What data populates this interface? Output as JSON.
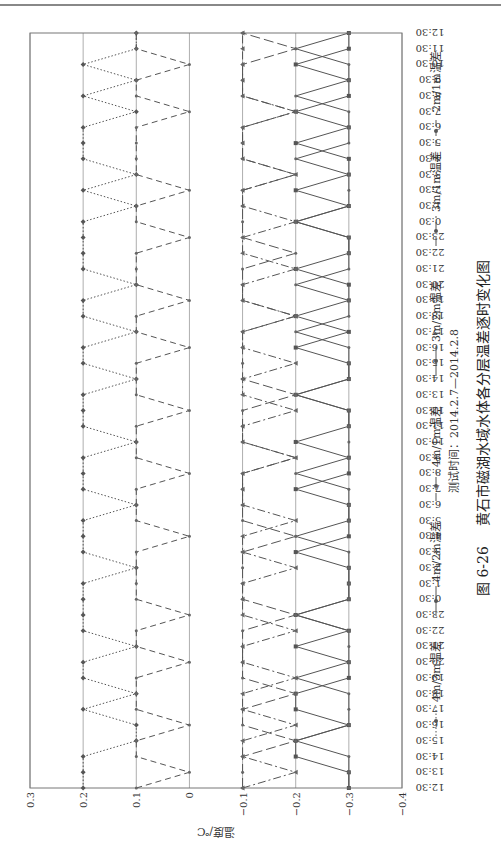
{
  "chart_data": {
    "type": "line",
    "title": "黄石市磁湖水域水体各分层温差逐时变化图",
    "figure_label": "图 6-26",
    "subtitle": "测试时间：2014.2.7—2014.2.8",
    "xlabel": "",
    "ylabel": "温度/℃",
    "ylim": [
      -0.4,
      0.3
    ],
    "yticks": [
      "0.3",
      "0.2",
      "0.1",
      "0",
      "−0.1",
      "−0.2",
      "−0.3",
      "−0.4"
    ],
    "x": [
      "12:30",
      "13:30",
      "14:30",
      "15:30",
      "16:30",
      "17:30",
      "18:30",
      "19:30",
      "20:30",
      "21:30",
      "22:30",
      "23:30",
      "0:30",
      "1:30",
      "2:30",
      "3:30",
      "4:30",
      "5:30",
      "6:30",
      "7:30",
      "8:30",
      "9:30",
      "10:30",
      "11:30",
      "12:30",
      "13:30",
      "14:30",
      "15:30",
      "16:30",
      "17:30",
      "18:30",
      "19:30",
      "20:30",
      "21:30",
      "22:30",
      "23:30",
      "0:30",
      "1:30",
      "2:30",
      "3:30",
      "4:30",
      "5:30",
      "6:30",
      "7:30",
      "8:30",
      "9:30",
      "10:30",
      "11:30",
      "12:30"
    ],
    "grid": true,
    "legend_position": "bottom",
    "series": [
      {
        "name": "4m/3m温差",
        "marker": "diamond",
        "dash": "dotted",
        "values": [
          0.2,
          0.2,
          0.2,
          0.1,
          0.1,
          0.2,
          0.1,
          0.2,
          0.2,
          0.1,
          0.2,
          0.2,
          0.2,
          0.2,
          0.1,
          0.2,
          0.2,
          0.2,
          0.1,
          0.2,
          0.2,
          0.2,
          0.1,
          0.2,
          0.2,
          0.2,
          0.1,
          0.2,
          0.2,
          0.1,
          0.2,
          0.2,
          0.1,
          0.2,
          0.2,
          0.2,
          0.2,
          0.1,
          0.2,
          0.1,
          0.2,
          0.2,
          0.2,
          0.1,
          0.2,
          0.1,
          0.2,
          0.1,
          0.1
        ]
      },
      {
        "name": "4m/2m温差",
        "marker": "square",
        "dash": "solid",
        "values": [
          -0.3,
          -0.3,
          -0.2,
          -0.2,
          -0.3,
          -0.2,
          -0.2,
          -0.3,
          -0.3,
          -0.2,
          -0.3,
          -0.2,
          -0.3,
          -0.3,
          -0.3,
          -0.2,
          -0.3,
          -0.3,
          -0.3,
          -0.2,
          -0.3,
          -0.3,
          -0.2,
          -0.3,
          -0.3,
          -0.2,
          -0.3,
          -0.3,
          -0.2,
          -0.3,
          -0.2,
          -0.3,
          -0.3,
          -0.2,
          -0.3,
          -0.3,
          -0.2,
          -0.3,
          -0.2,
          -0.3,
          -0.3,
          -0.2,
          -0.3,
          -0.2,
          -0.3,
          -0.3,
          -0.2,
          -0.3,
          -0.3
        ]
      },
      {
        "name": "4m/1m温差",
        "marker": "triangle",
        "dash": "dashdot",
        "values": [
          -0.1,
          -0.2,
          -0.1,
          -0.1,
          -0.2,
          -0.1,
          -0.1,
          -0.2,
          -0.1,
          -0.1,
          -0.2,
          -0.1,
          -0.1,
          -0.1,
          -0.2,
          -0.1,
          -0.1,
          -0.2,
          -0.1,
          -0.1,
          -0.1,
          -0.2,
          -0.1,
          -0.1,
          -0.2,
          -0.1,
          -0.1,
          -0.2,
          -0.1,
          -0.1,
          -0.2,
          -0.1,
          -0.1,
          -0.2,
          -0.1,
          -0.1,
          -0.2,
          -0.1,
          -0.1,
          -0.2,
          -0.1,
          -0.1,
          -0.1,
          -0.2,
          -0.1,
          -0.1,
          -0.1,
          -0.1,
          -0.1
        ]
      },
      {
        "name": "3m/2m温差",
        "marker": "x",
        "dash": "solid",
        "values": [
          -0.3,
          -0.3,
          -0.3,
          -0.2,
          -0.3,
          -0.3,
          -0.3,
          -0.2,
          -0.3,
          -0.3,
          -0.3,
          -0.2,
          -0.3,
          -0.3,
          -0.3,
          -0.3,
          -0.2,
          -0.3,
          -0.3,
          -0.3,
          -0.2,
          -0.3,
          -0.3,
          -0.3,
          -0.3,
          -0.2,
          -0.3,
          -0.3,
          -0.3,
          -0.2,
          -0.3,
          -0.3,
          -0.2,
          -0.3,
          -0.3,
          -0.3,
          -0.2,
          -0.3,
          -0.3,
          -0.3,
          -0.2,
          -0.3,
          -0.3,
          -0.3,
          -0.2,
          -0.3,
          -0.3,
          -0.2,
          -0.3
        ]
      },
      {
        "name": "3m/1m温差",
        "marker": "star",
        "dash": "longdash",
        "values": [
          -0.1,
          -0.1,
          -0.1,
          -0.2,
          -0.1,
          -0.1,
          -0.2,
          -0.1,
          -0.1,
          -0.1,
          -0.1,
          -0.2,
          -0.1,
          -0.1,
          -0.1,
          -0.1,
          -0.2,
          -0.1,
          -0.1,
          -0.1,
          -0.1,
          -0.2,
          -0.1,
          -0.1,
          -0.1,
          -0.2,
          -0.1,
          -0.1,
          -0.1,
          -0.1,
          -0.2,
          -0.1,
          -0.1,
          -0.1,
          -0.2,
          -0.1,
          -0.1,
          -0.1,
          -0.1,
          -0.2,
          -0.1,
          -0.1,
          -0.1,
          -0.2,
          -0.1,
          -0.1,
          -0.1,
          -0.2,
          -0.1
        ]
      },
      {
        "name": "2m/1m温差",
        "marker": "plus",
        "dash": "dashed",
        "values": [
          0.1,
          0,
          0.1,
          0.1,
          0,
          0.1,
          0.1,
          0.1,
          0,
          0.1,
          0.1,
          0,
          0.1,
          0.1,
          0.1,
          0.1,
          0,
          0.1,
          0.1,
          0.1,
          0,
          0.1,
          0.1,
          0.1,
          0,
          0.1,
          0.1,
          0.1,
          0,
          0.1,
          0.1,
          0,
          0.1,
          0.1,
          0.1,
          0,
          0.1,
          0.1,
          0,
          0.1,
          0.1,
          0.1,
          0.1,
          0,
          0.1,
          0.1,
          0,
          0.1,
          0.1
        ]
      }
    ]
  }
}
